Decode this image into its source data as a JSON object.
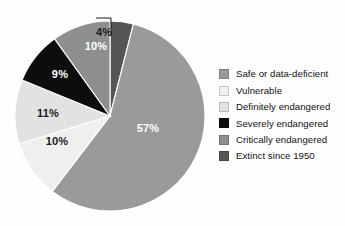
{
  "chart_data": {
    "type": "pie",
    "title": "",
    "categories": [
      "Safe or data-deficient",
      "Vulnerable",
      "Definitely endangered",
      "Severely endangered",
      "Critically endangered",
      "Extinct since 1950"
    ],
    "values": [
      57,
      10,
      11,
      9,
      10,
      4
    ],
    "value_labels": [
      "57%",
      "10%",
      "11%",
      "9%",
      "10%",
      "4%"
    ],
    "colors": [
      "#9a9a9a",
      "#efefef",
      "#e2e2e2",
      "#0d0d0d",
      "#8e8e8e",
      "#555555"
    ],
    "label_colors": [
      "light",
      "dark",
      "dark",
      "light",
      "light",
      "dark"
    ],
    "units": "percent",
    "legend_position": "right",
    "grid": false,
    "start_angle_deg": 0,
    "direction": "clockwise",
    "callout_slice": "Extinct since 1950"
  },
  "legend": {
    "items": [
      {
        "label": "Safe or data-deficient",
        "color": "#9a9a9a"
      },
      {
        "label": "Vulnerable",
        "color": "#efefef"
      },
      {
        "label": "Definitely endangered",
        "color": "#e2e2e2"
      },
      {
        "label": "Severely endangered",
        "color": "#0d0d0d"
      },
      {
        "label": "Critically endangered",
        "color": "#8e8e8e"
      },
      {
        "label": "Extinct since 1950",
        "color": "#555555"
      }
    ]
  },
  "slice_labels": [
    {
      "text": "57%",
      "x": 148,
      "y": 128,
      "tone": "light"
    },
    {
      "text": "10%",
      "x": 57,
      "y": 141,
      "tone": "dark"
    },
    {
      "text": "11%",
      "x": 48,
      "y": 113,
      "tone": "dark"
    },
    {
      "text": "9%",
      "x": 60,
      "y": 74,
      "tone": "light"
    },
    {
      "text": "10%",
      "x": 96,
      "y": 46,
      "tone": "light"
    }
  ],
  "callout": {
    "text": "4%"
  }
}
